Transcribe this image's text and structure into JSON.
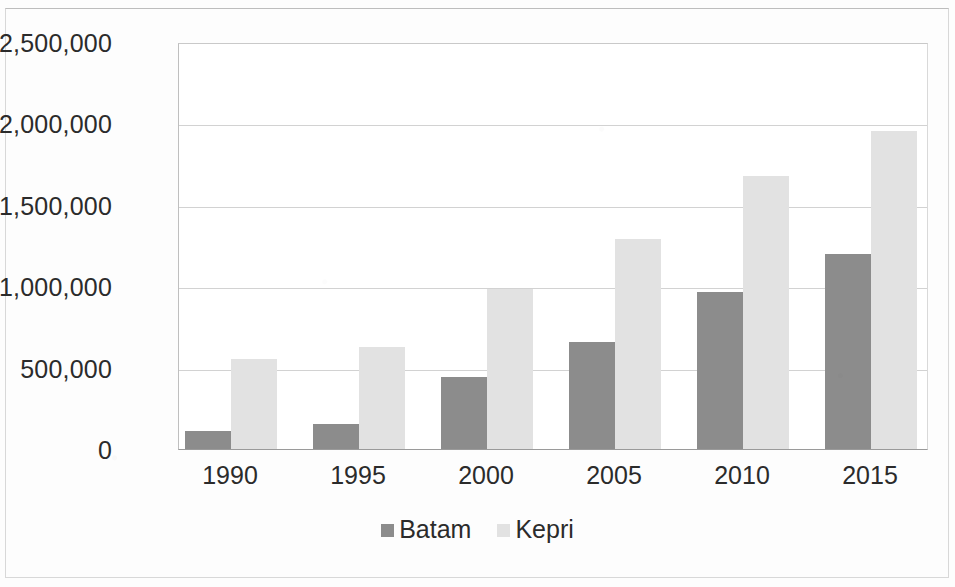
{
  "chart_data": {
    "type": "bar",
    "title": "",
    "subtitle": "",
    "xlabel": "",
    "ylabel": "",
    "categories": [
      "1990",
      "1995",
      "2000",
      "2005",
      "2010",
      "2015"
    ],
    "series": [
      {
        "name": "Batam",
        "color": "#8c8c8c",
        "values": [
          110000,
          155000,
          440000,
          655000,
          965000,
          1200000
        ]
      },
      {
        "name": "Kepri",
        "color": "#e2e2e2",
        "values": [
          550000,
          625000,
          980000,
          1290000,
          1680000,
          1955000
        ]
      }
    ],
    "ylim": [
      0,
      2500000
    ],
    "ytick_values": [
      0,
      500000,
      1000000,
      1500000,
      2000000,
      2500000
    ],
    "ytick_labels": [
      "0",
      "500,000",
      "1,000,000",
      "1,500,000",
      "2,000,000",
      "2,500,000"
    ],
    "grid": true,
    "grid_axis": "y",
    "legend_position": "bottom",
    "legend": [
      "Batam",
      "Kepri"
    ]
  },
  "axes": {
    "y": {
      "ticks": [
        {
          "label": "2,500,000",
          "value": 2500000
        },
        {
          "label": "2,000,000",
          "value": 2000000
        },
        {
          "label": "1,500,000",
          "value": 1500000
        },
        {
          "label": "1,000,000",
          "value": 1000000
        },
        {
          "label": "500,000",
          "value": 500000
        },
        {
          "label": "0",
          "value": 0
        }
      ]
    },
    "x": {
      "ticks": [
        "1990",
        "1995",
        "2000",
        "2005",
        "2010",
        "2015"
      ]
    }
  },
  "legend": {
    "items": [
      {
        "label": "Batam",
        "color": "#8c8c8c"
      },
      {
        "label": "Kepri",
        "color": "#e2e2e2"
      }
    ]
  }
}
